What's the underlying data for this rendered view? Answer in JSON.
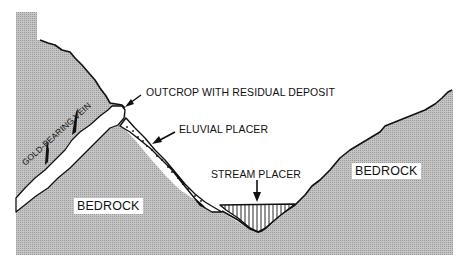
{
  "diagram": {
    "title": "",
    "type": "geologic-cross-section",
    "labels": {
      "outcrop": "OUTCROP WITH RESIDUAL DEPOSIT",
      "eluvial": "ELUVIAL PLACER",
      "stream": "STREAM PLACER",
      "vein": "GOLD-BEARING VEIN",
      "bedrock_left": "BEDROCK",
      "bedrock_right": "BEDROCK"
    },
    "colors": {
      "bedrock_fill": "#b4b4b4",
      "outline": "#111111",
      "deposit_fill": "#ffffff",
      "background": "#ffffff"
    }
  }
}
